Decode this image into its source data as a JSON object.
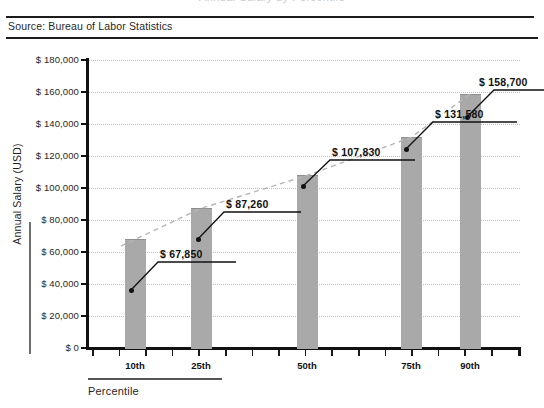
{
  "source": {
    "text": "Source: Bureau of Labor Statistics"
  },
  "clipped_title": "Annual Salary by Percentile",
  "axis_titles": {
    "y": "Annual Salary (USD)",
    "x": "Percentile"
  },
  "colors": {
    "bar": "#a9a9a9",
    "axis": "#111111",
    "grid": "#c0c0c8",
    "trend": "#b5b5bd",
    "text": "#1f1f1f"
  },
  "chart_data": {
    "type": "bar",
    "title": "Annual Salary by Percentile",
    "xlabel": "Percentile",
    "ylabel": "Annual Salary (USD)",
    "categories": [
      "10th",
      "25th",
      "50th",
      "75th",
      "90th"
    ],
    "values": [
      67850,
      87260,
      107830,
      131580,
      158700
    ],
    "data_labels": [
      "$ 67,850",
      "$ 87,260",
      "$ 107,830",
      "$ 131,580",
      "$ 158,700"
    ],
    "ylim": [
      0,
      180000
    ],
    "ytick_values": [
      0,
      20000,
      40000,
      60000,
      80000,
      100000,
      120000,
      140000,
      160000,
      180000
    ],
    "ytick_labels": [
      "$ 0",
      "$ 20,000",
      "$ 40,000",
      "$ 60,000",
      "$ 80,000",
      "$ 100,000",
      "$ 120,000",
      "$ 140,000",
      "$ 160,000",
      "$ 180,000"
    ],
    "grid": true,
    "legend": "none",
    "overlay_series": {
      "name": "trend",
      "style": "dashed",
      "values": [
        67850,
        87260,
        107830,
        131580,
        158700
      ]
    }
  }
}
